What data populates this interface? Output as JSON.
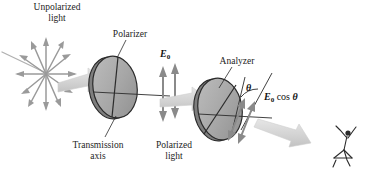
{
  "figure": {
    "background": "#ffffff",
    "beam_color": "#d8d8d8",
    "disk_fill": "#a9a9a9",
    "disk_stroke": "#2b2b2b",
    "arrow_color": "#8a8a8a",
    "text_color": "#1d1d1d"
  },
  "labels": {
    "unpolarized_line1": "Unpolarized",
    "unpolarized_line2": "light",
    "polarizer": "Polarizer",
    "analyzer": "Analyzer",
    "transmission_line1": "Transmission",
    "transmission_line2": "axis",
    "polarized_line1": "Polarized",
    "polarized_line2": "light"
  },
  "math": {
    "e0_symbol": "E",
    "e0_subscript": "0",
    "cos_text": "cos",
    "theta_symbol": "θ",
    "e0_cos_theta": "E0 cos θ"
  },
  "elements": {
    "unpolarized_burst": "radial double-headed arrows",
    "polarized_arrows": "two vertical double-headed arrows",
    "analyzer_arrows": "two tilted double-headed arrows",
    "observer": "person viewing the transmitted light"
  }
}
